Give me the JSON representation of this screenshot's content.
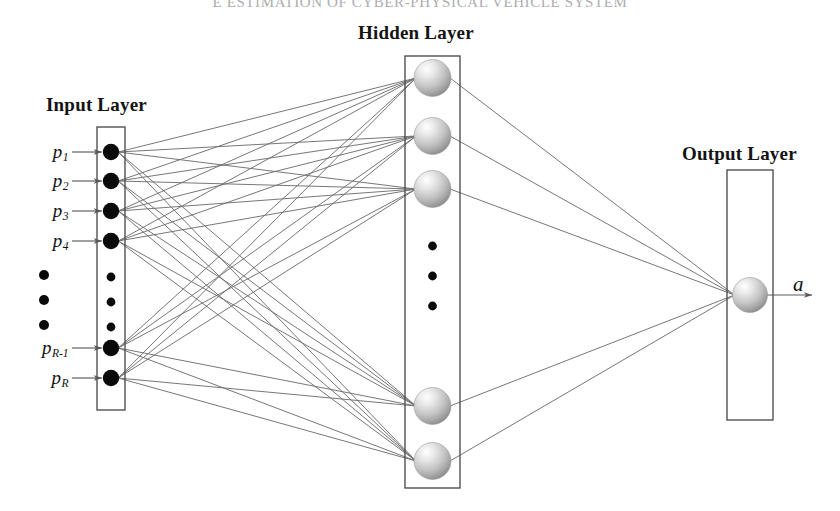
{
  "document": {
    "running_head": "E ESTIMATION OF CYBER-PHYSICAL VEHICLE SYSTEM"
  },
  "diagram": {
    "type": "neural-network-architecture",
    "layers": [
      {
        "id": "input",
        "caption": "Input Layer",
        "node_style": "filled-black-dot",
        "visible_nodes": 6,
        "ellipsis_dots": 3,
        "inputs": [
          {
            "base": "p",
            "subscript": "1"
          },
          {
            "base": "p",
            "subscript": "2"
          },
          {
            "base": "p",
            "subscript": "3"
          },
          {
            "base": "p",
            "subscript": "4"
          },
          {
            "base": "p",
            "subscript": "R-1"
          },
          {
            "base": "p",
            "subscript": "R"
          }
        ]
      },
      {
        "id": "hidden",
        "caption": "Hidden Layer",
        "node_style": "shaded-sphere",
        "visible_nodes": 5,
        "ellipsis_dots": 3
      },
      {
        "id": "output",
        "caption": "Output Layer",
        "node_style": "shaded-sphere",
        "visible_nodes": 1,
        "ellipsis_dots": 0,
        "output_label": "a"
      }
    ],
    "connections": {
      "input_to_hidden": "fully-connected",
      "hidden_to_output": "fully-connected",
      "edge_count": 35
    }
  },
  "colors": {
    "background": "#ffffff",
    "box_stroke": "#4a4a4a",
    "edge_stroke": "#707070",
    "input_node_fill": "#0a0a0a",
    "sphere_light": "#fdfdfd",
    "sphere_mid": "#c2c2c2",
    "sphere_dark": "#8d8d8d",
    "text": "#141414",
    "running_head": "#8e8e93"
  },
  "geometry": {
    "width": 840,
    "height": 511,
    "input_box": {
      "x": 97,
      "y": 127,
      "w": 28,
      "h": 283
    },
    "hidden_box": {
      "x": 405,
      "y": 56,
      "w": 55,
      "h": 432
    },
    "output_box": {
      "x": 727,
      "y": 170,
      "w": 46,
      "h": 250
    },
    "input_node_cy": [
      152,
      181,
      211,
      241,
      348,
      378
    ],
    "input_dots_cy": [
      277,
      302,
      327
    ],
    "hidden_node_cy": [
      78,
      136,
      189,
      406,
      461
    ],
    "hidden_dots_cy": [
      246,
      276,
      306
    ],
    "output_node_cy": [
      295
    ]
  }
}
